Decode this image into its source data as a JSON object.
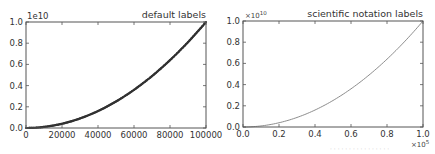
{
  "chart_data": [
    {
      "type": "line",
      "title": "default labels",
      "xlabel": "",
      "ylabel": "",
      "x_tick_labels": [
        "0",
        "20000",
        "40000",
        "60000",
        "80000",
        "100000"
      ],
      "x_ticks": [
        0,
        20000,
        40000,
        60000,
        80000,
        100000
      ],
      "y_tick_labels": [
        "0.0",
        "0.2",
        "0.4",
        "0.6",
        "0.8",
        "1.0"
      ],
      "y_ticks": [
        0.0,
        0.2,
        0.4,
        0.6,
        0.8,
        1.0
      ],
      "y_offset_label": "1e10",
      "xlim": [
        0,
        100000
      ],
      "ylim": [
        0,
        10000000000.0
      ],
      "grid": false,
      "series": [
        {
          "name": "y = x^2",
          "style": "dark markers (dense)",
          "color": "#333333",
          "x": [
            0,
            10000,
            20000,
            30000,
            40000,
            50000,
            60000,
            70000,
            80000,
            90000,
            100000
          ],
          "y": [
            0,
            100000000.0,
            400000000.0,
            900000000.0,
            1600000000.0,
            2500000000.0,
            3600000000.0,
            4900000000.0,
            6400000000.0,
            8100000000.0,
            10000000000.0
          ]
        }
      ]
    },
    {
      "type": "line",
      "title": "scientific notation labels",
      "xlabel": "",
      "ylabel": "",
      "x_tick_labels": [
        "0.0",
        "0.2",
        "0.4",
        "0.6",
        "0.8",
        "1.0"
      ],
      "x_ticks": [
        0.0,
        0.2,
        0.4,
        0.6,
        0.8,
        1.0
      ],
      "x_offset_label": "×10",
      "x_offset_exp": "5",
      "y_tick_labels": [
        "0.0",
        "0.2",
        "0.4",
        "0.6",
        "0.8",
        "1.0"
      ],
      "y_ticks": [
        0.0,
        0.2,
        0.4,
        0.6,
        0.8,
        1.0
      ],
      "y_offset_label": "×10",
      "y_offset_exp": "10",
      "xlim": [
        0,
        100000
      ],
      "ylim": [
        0,
        10000000000.0
      ],
      "grid": false,
      "series": [
        {
          "name": "y = x^2",
          "style": "thin line",
          "color": "#777777",
          "x": [
            0,
            10000,
            20000,
            30000,
            40000,
            50000,
            60000,
            70000,
            80000,
            90000,
            100000
          ],
          "y": [
            0,
            100000000.0,
            400000000.0,
            900000000.0,
            1600000000.0,
            2500000000.0,
            3600000000.0,
            4900000000.0,
            6400000000.0,
            8100000000.0,
            10000000000.0
          ]
        }
      ]
    }
  ],
  "layout": {
    "panels": [
      {
        "left": 26,
        "top": 22,
        "right": 206,
        "bottom": 128
      },
      {
        "left": 243,
        "top": 21,
        "right": 423,
        "bottom": 127
      }
    ]
  },
  "watermark": "· · · ·  · · · ·  ·  ·  · · · ·  ·  ·"
}
